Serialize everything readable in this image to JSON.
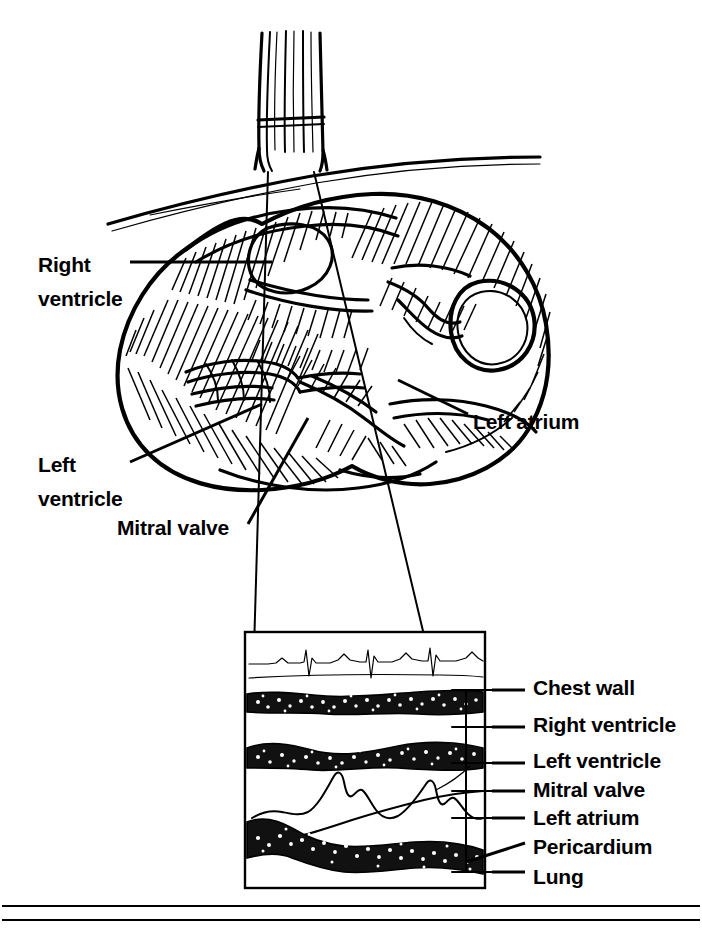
{
  "figure": {
    "type": "medical-illustration",
    "anatomy_labels_left": [
      {
        "id": "right-ventricle",
        "line1": "Right",
        "line2": "ventricle",
        "x": 38,
        "y": 248
      },
      {
        "id": "left-ventricle",
        "line1": "Left",
        "line2": "ventricle",
        "x": 38,
        "y": 448
      },
      {
        "id": "mitral-valve",
        "line1": "Mitral valve",
        "line2": "",
        "x": 117,
        "y": 517
      }
    ],
    "anatomy_labels_right": [
      {
        "id": "left-atrium",
        "text": "Left atrium",
        "x": 473,
        "y": 411
      }
    ],
    "trace_labels": [
      {
        "id": "chest-wall",
        "text": "Chest wall",
        "x": 533,
        "y": 677
      },
      {
        "id": "right-ventricle",
        "text": "Right ventricle",
        "x": 533,
        "y": 714
      },
      {
        "id": "left-ventricle",
        "text": "Left ventricle",
        "x": 533,
        "y": 750
      },
      {
        "id": "mitral-valve",
        "text": "Mitral valve",
        "x": 533,
        "y": 779
      },
      {
        "id": "left-atrium",
        "text": "Left atrium",
        "x": 533,
        "y": 807
      },
      {
        "id": "pericardium",
        "text": "Pericardium",
        "x": 533,
        "y": 836
      },
      {
        "id": "lung",
        "text": "Lung",
        "x": 533,
        "y": 866
      }
    ],
    "colors": {
      "ink": "#000000",
      "paper": "#ffffff"
    },
    "echo_panel": {
      "x": 245,
      "y": 632,
      "width": 240,
      "height": 256
    },
    "ecg": {
      "beats": 3,
      "description": "three-beat ECG rhythm strip above the M-mode sweep"
    }
  }
}
